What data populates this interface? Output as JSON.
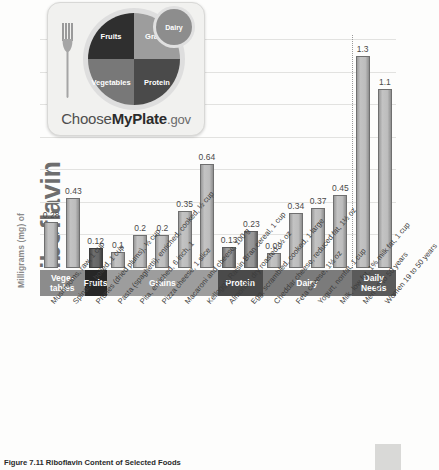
{
  "chart_data": {
    "type": "bar",
    "title": "Riboflavin Content of Selected Foods",
    "ylabel_small": "Milligrams (mg) of",
    "ylabel_big": "Riboflavin",
    "xlabel": "",
    "ylim": [
      0,
      1.4
    ],
    "grid": true,
    "gridlines": [
      0.2,
      0.4,
      0.6,
      0.8,
      1.0,
      1.2,
      1.4
    ],
    "legend": "none",
    "categories": [
      "Mushrooms, raw, 1 cup",
      "Spinach, boiled, 1 cup",
      "Prunes (dried plums), ½ cup",
      "Pasta (spaghetti), enriched, cooked, ½ cup",
      "Pita, enriched, 6 inch, 1",
      "Pizza cheese, 1 slice",
      "Macaroni and cheese, 100 g",
      "Kellogg's Raisin Bran cereal, 1 cup",
      "Almonds, dry roasted, ½ oz",
      "Egg, scrambled, cooked, 1 large",
      "Cheddar cheese, reduced fat, 1½ oz",
      "Feta cheese, 1½ oz",
      "Yogurt, nonfat, 1 cup",
      "Milk, low fat, 1% milk fat, 1 cup",
      "Men 19 to 50 years",
      "Women 19 to 50 years"
    ],
    "values": [
      0.28,
      0.43,
      0.12,
      0.1,
      0.2,
      0.2,
      0.35,
      0.64,
      0.13,
      0.23,
      0.09,
      0.34,
      0.37,
      0.45,
      1.3,
      1.1
    ],
    "value_labels": [
      "0.28",
      "0.43",
      "0.12",
      "0.1",
      "0.2",
      "0.2",
      "0.35",
      "0.64",
      "0.13",
      "0.23",
      "0.09",
      "0.34",
      "0.37",
      "0.45",
      "1.3",
      "1.1"
    ],
    "groups": [
      {
        "label": "Vege-\ntables",
        "line1": "Vege-",
        "line2": "tables",
        "start": 0,
        "end": 1,
        "shade": "#8c8c8c"
      },
      {
        "label": "Fruits",
        "line1": "Fruits",
        "line2": "",
        "start": 2,
        "end": 2,
        "shade": "#262626"
      },
      {
        "label": "Grains",
        "line1": "Grains",
        "line2": "",
        "start": 3,
        "end": 7,
        "shade": "#9d9d9d"
      },
      {
        "label": "Protein",
        "line1": "Protein",
        "line2": "",
        "start": 8,
        "end": 9,
        "shade": "#4a4a4a"
      },
      {
        "label": "Dairy",
        "line1": "Dairy",
        "line2": "",
        "start": 10,
        "end": 13,
        "shade": "#7b7b7b"
      },
      {
        "label": "Daily Needs",
        "line1": "Daily",
        "line2": "Needs",
        "start": 14,
        "end": 15,
        "shade": "#5a5a5a"
      }
    ],
    "daily_needs_divider_after_index": 13,
    "annotations": []
  },
  "logo": {
    "name": "MyPlate",
    "brand_choose": "Choose",
    "brand_myplate": "MyPlate",
    "brand_gov": ".gov",
    "sections": {
      "fruits": "Fruits",
      "grains": "Grains",
      "vegetables": "Vegetables",
      "protein": "Protein",
      "dairy": "Dairy"
    }
  },
  "caption": "Figure 7.11 Riboflavin Content of Selected Foods"
}
